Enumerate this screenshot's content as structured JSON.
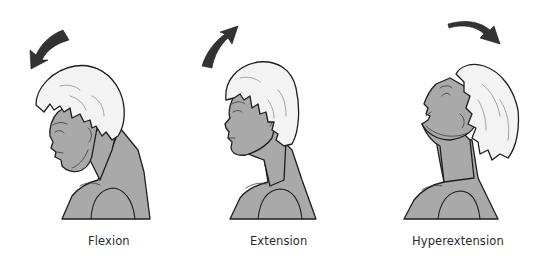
{
  "figure": {
    "panels": [
      {
        "id": "flexion",
        "label": "Flexion",
        "arrow_direction": "forward-down"
      },
      {
        "id": "extension",
        "label": "Extension",
        "arrow_direction": "backward-up"
      },
      {
        "id": "hyperextension",
        "label": "Hyperextension",
        "arrow_direction": "backward"
      }
    ],
    "colors": {
      "skin": "#a9a9a9",
      "hair": "#f3f3f3",
      "outline": "#1e1e1e",
      "arrow": "#333333",
      "caption": "#2a2a2a",
      "background": "#ffffff"
    }
  }
}
